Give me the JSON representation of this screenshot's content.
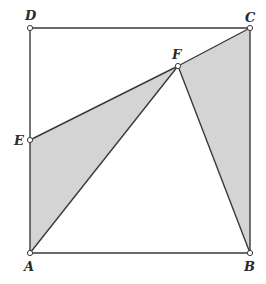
{
  "diagram": {
    "type": "geometry-figure",
    "points": {
      "A": {
        "label": "A",
        "x": 30,
        "y": 253
      },
      "B": {
        "label": "B",
        "x": 250,
        "y": 253
      },
      "C": {
        "label": "C",
        "x": 250,
        "y": 28
      },
      "D": {
        "label": "D",
        "x": 30,
        "y": 28
      },
      "E": {
        "label": "E",
        "x": 30,
        "y": 140
      },
      "F": {
        "label": "F",
        "x": 178,
        "y": 66
      }
    },
    "segments": [
      [
        "A",
        "B"
      ],
      [
        "B",
        "C"
      ],
      [
        "C",
        "D"
      ],
      [
        "D",
        "A"
      ],
      [
        "E",
        "F"
      ],
      [
        "F",
        "C"
      ],
      [
        "A",
        "F"
      ],
      [
        "F",
        "B"
      ]
    ],
    "shaded_regions": [
      {
        "name": "triangle-AEF",
        "vertices": [
          "A",
          "E",
          "F"
        ]
      },
      {
        "name": "triangle-BCF",
        "vertices": [
          "B",
          "C",
          "F"
        ]
      }
    ],
    "colors": {
      "shade": "#d4d4d4",
      "line": "#3a3a3a",
      "background": "#ffffff"
    }
  }
}
